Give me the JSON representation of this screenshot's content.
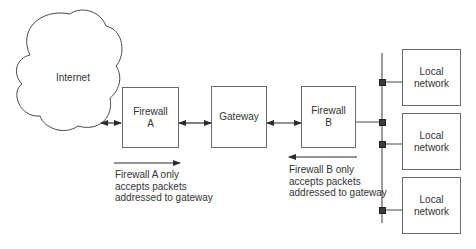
{
  "diagram": {
    "cloud": {
      "label": "Internet"
    },
    "nodes": {
      "firewall_a": {
        "line1": "Firewall",
        "line2": "A"
      },
      "gateway": {
        "label": "Gateway"
      },
      "firewall_b": {
        "line1": "Firewall",
        "line2": "B"
      },
      "local_networks": [
        {
          "line1": "Local",
          "line2": "network"
        },
        {
          "line1": "Local",
          "line2": "network"
        },
        {
          "line1": "Local",
          "line2": "network"
        }
      ]
    },
    "annotations": {
      "firewall_a": {
        "direction": "right",
        "lines": [
          "Firewall A only",
          "accepts packets",
          "addressed to gateway"
        ]
      },
      "firewall_b": {
        "direction": "left",
        "lines": [
          "Firewall B only",
          "accepts packets",
          "addressed to gateway"
        ]
      }
    },
    "colors": {
      "line": "#4a4a4a",
      "box_border": "#6a6a6a",
      "connector": "#3a3a3a",
      "text": "#333333"
    }
  }
}
